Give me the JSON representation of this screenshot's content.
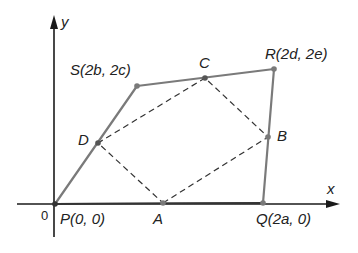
{
  "diagram": {
    "colors": {
      "axis": "#1a1a1a",
      "quad": "#7a7a7a",
      "dashed": "#333333",
      "point": "#7a7a7a",
      "text": "#222222"
    },
    "axes": {
      "x_label": "x",
      "y_label": "y",
      "origin_label": "0"
    },
    "quadrilateral": {
      "P": {
        "name": "P",
        "coords": "(0, 0)"
      },
      "Q": {
        "name": "Q",
        "coords": "(2a, 0)"
      },
      "R": {
        "name": "R",
        "coords": "(2d, 2e)"
      },
      "S": {
        "name": "S",
        "coords": "(2b, 2c)"
      }
    },
    "midpoints": {
      "A": "A",
      "B": "B",
      "C": "C",
      "D": "D"
    },
    "labels": {
      "P": "P(0, 0)",
      "Q": "Q(2a, 0)",
      "R": "R(2d, 2e)",
      "S": "S(2b, 2c)"
    }
  }
}
